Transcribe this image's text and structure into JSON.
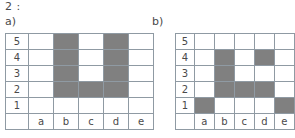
{
  "header": {
    "question_number": "2 :"
  },
  "parts": [
    {
      "label": "a)",
      "grid": {
        "columns": [
          "a",
          "b",
          "c",
          "d",
          "e"
        ],
        "rows": [
          "5",
          "4",
          "3",
          "2",
          "1"
        ],
        "filled": {
          "5": [
            "b",
            "d"
          ],
          "4": [
            "b",
            "d"
          ],
          "3": [
            "b",
            "d"
          ],
          "2": [
            "b",
            "c",
            "d"
          ],
          "1": []
        }
      }
    },
    {
      "label": "b)",
      "grid": {
        "columns": [
          "a",
          "b",
          "c",
          "d",
          "e"
        ],
        "rows": [
          "5",
          "4",
          "3",
          "2",
          "1"
        ],
        "filled": {
          "5": [],
          "4": [
            "b",
            "d"
          ],
          "3": [
            "b"
          ],
          "2": [
            "b",
            "c",
            "d"
          ],
          "1": [
            "a",
            "e"
          ]
        }
      }
    }
  ],
  "colors": {
    "fill": "#808080",
    "grid_line": "#8f9aa3",
    "text": "#4a4a4a",
    "background": "#ffffff"
  }
}
